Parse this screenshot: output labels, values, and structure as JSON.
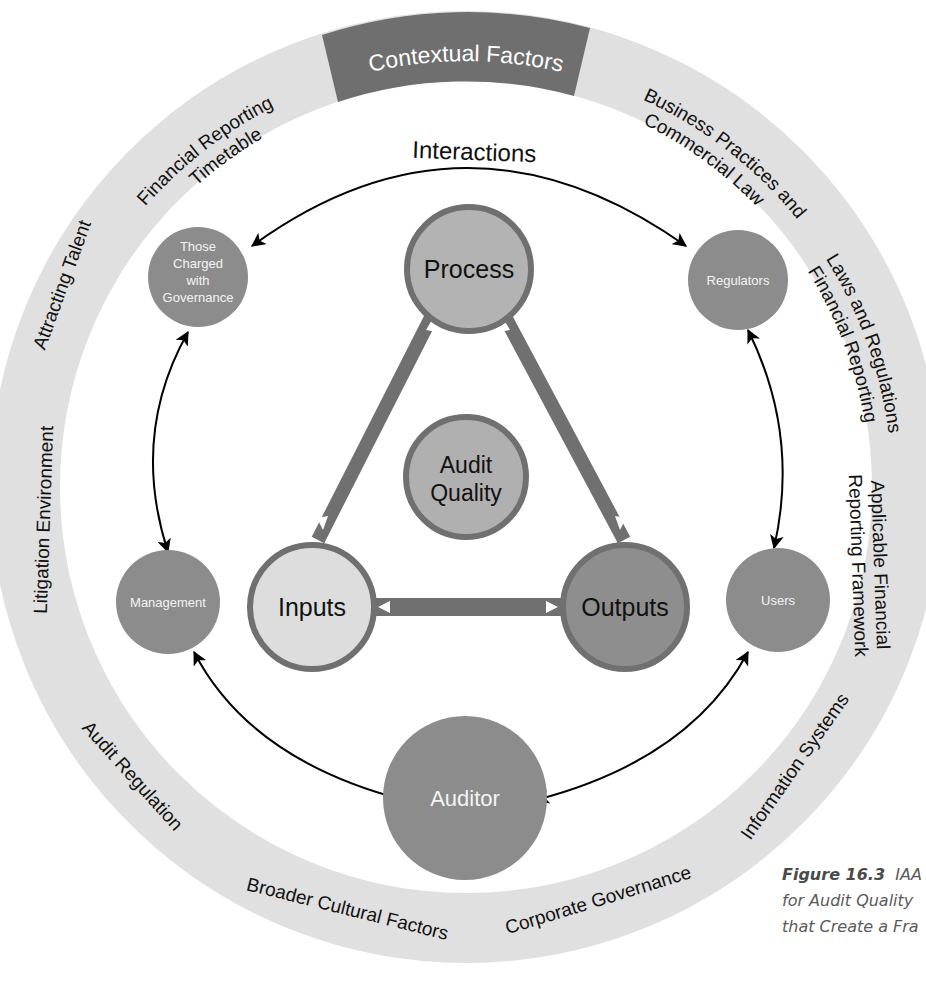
{
  "ring": {
    "title": "Contextual Factors",
    "factors": [
      {
        "id": "frt",
        "lines": [
          "Financial Reporting",
          "Timetable"
        ]
      },
      {
        "id": "bpcl",
        "lines": [
          "Business Practices and",
          "Commercial Law"
        ]
      },
      {
        "id": "lrfr",
        "lines": [
          "Laws and Regulations",
          "Financial Reporting"
        ]
      },
      {
        "id": "afrf",
        "lines": [
          "Applicable Financial",
          "Reporting Framework"
        ]
      },
      {
        "id": "is",
        "lines": [
          "Information Systems"
        ]
      },
      {
        "id": "cg",
        "lines": [
          "Corporate Governance"
        ]
      },
      {
        "id": "bcf",
        "lines": [
          "Broader Cultural Factors"
        ]
      },
      {
        "id": "ar",
        "lines": [
          "Audit Regulation"
        ]
      },
      {
        "id": "le",
        "lines": [
          "Litigation Environment"
        ]
      },
      {
        "id": "at",
        "lines": [
          "Attracting Talent"
        ]
      }
    ]
  },
  "interactions_label": "Interactions",
  "stakeholders": {
    "tcwg": [
      "Those",
      "Charged",
      "with",
      "Governance"
    ],
    "regulators": "Regulators",
    "management": "Management",
    "users": "Users",
    "auditor": "Auditor"
  },
  "core": {
    "process": "Process",
    "inputs": "Inputs",
    "outputs": "Outputs",
    "audit_quality": [
      "Audit",
      "Quality"
    ]
  },
  "caption": {
    "label": "Figure 16.3",
    "lines": [
      "IAA",
      "for Audit Quality",
      "that Create a Fra"
    ]
  },
  "colors": {
    "ring_light": "#e0e0e0",
    "ring_dark": "#6f6f6f",
    "node_mid": "#8c8c8c",
    "process_fill": "#b3b3b3",
    "inputs_fill": "#dddddd",
    "outputs_fill": "#8e8e8e",
    "stroke": "#707070"
  }
}
